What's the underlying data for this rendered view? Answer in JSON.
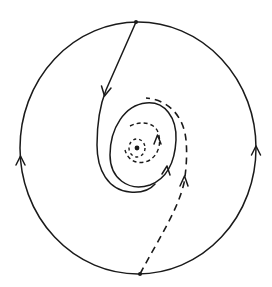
{
  "diagram": {
    "type": "phase-portrait",
    "colors": {
      "stroke": "#1a1a1a",
      "background": "#ffffff"
    },
    "elements": {
      "outer_orbit": {
        "style": "solid",
        "direction": "counterclockwise",
        "arrows": 2
      },
      "limit_cycle": {
        "style": "solid",
        "direction": "counterclockwise",
        "arrows": 1
      },
      "outer_solid_trajectory": {
        "style": "solid",
        "from": "top-point",
        "arrows": 1
      },
      "outer_dashed_trajectory": {
        "style": "dashed",
        "from": "bottom-point",
        "arrows": 1
      },
      "inner_dashed_spiral": {
        "style": "dashed",
        "arrows": 1
      },
      "equilibrium_orbit": {
        "style": "dotted"
      },
      "equilibrium_point": {
        "style": "dot"
      },
      "top_point": {
        "style": "dot"
      },
      "bottom_point": {
        "style": "dot"
      }
    }
  }
}
